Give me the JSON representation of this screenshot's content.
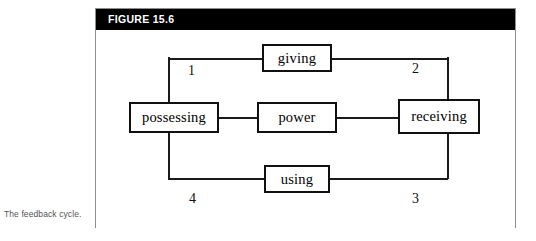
{
  "caption": {
    "text": "The feedback cycle."
  },
  "figure": {
    "header_label": "FIGURE 15.6",
    "header_background": "#000000",
    "header_text_color": "#ffffff",
    "frame_border_color": "#8e8e8e",
    "body_background": "#ffffff"
  },
  "diagram": {
    "type": "cycle-diagram",
    "line_color": "#1a1a1a",
    "node_border_color": "#111111",
    "nodes": [
      {
        "id": "giving",
        "label": "giving"
      },
      {
        "id": "possessing",
        "label": "possessing"
      },
      {
        "id": "power",
        "label": "power"
      },
      {
        "id": "receiving",
        "label": "receiving"
      },
      {
        "id": "using",
        "label": "using"
      }
    ],
    "segment_numbers": [
      {
        "id": "segment-1",
        "label": "1",
        "position": "top-left"
      },
      {
        "id": "segment-2",
        "label": "2",
        "position": "top-right"
      },
      {
        "id": "segment-3",
        "label": "3",
        "position": "bottom-right"
      },
      {
        "id": "segment-4",
        "label": "4",
        "position": "bottom-left"
      }
    ]
  }
}
